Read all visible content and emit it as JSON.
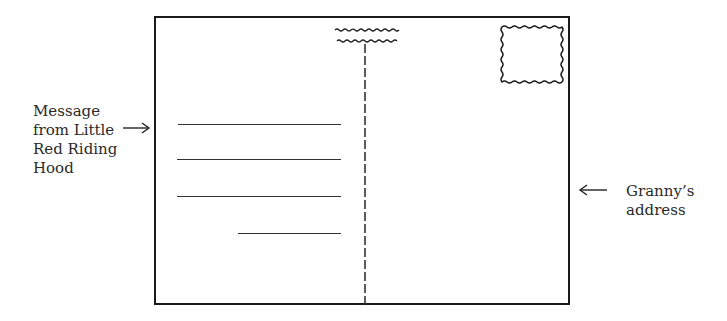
{
  "diagram": {
    "type": "postcard-back",
    "labels": {
      "left": [
        "Message",
        "from Little",
        "Red Riding",
        "Hood"
      ],
      "right": [
        "Granny’s",
        "address"
      ]
    },
    "arrows": {
      "left": "right-arrow-icon",
      "right": "left-arrow-icon"
    },
    "elements": {
      "stamp": "stamp-box",
      "divider": "dashed-vertical-divider",
      "wavy_lines": 2,
      "message_lines": 4
    },
    "colors": {
      "ink": "#1a1a1a",
      "background": "#ffffff"
    }
  }
}
